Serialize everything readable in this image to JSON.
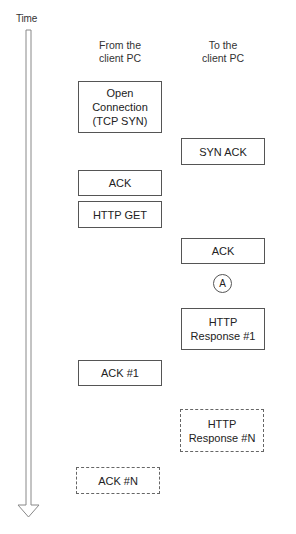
{
  "diagram": {
    "time_axis": {
      "label": "Time",
      "direction": "down"
    },
    "columns": [
      {
        "id": "from-client",
        "header": "From the\nclient PC"
      },
      {
        "id": "to-client",
        "header": "To the\nclient PC"
      }
    ],
    "messages": [
      {
        "column": "from-client",
        "label": "Open\nConnection\n(TCP SYN)",
        "style": "solid"
      },
      {
        "column": "to-client",
        "label": "SYN ACK",
        "style": "solid"
      },
      {
        "column": "from-client",
        "label": "ACK",
        "style": "solid"
      },
      {
        "column": "from-client",
        "label": "HTTP GET",
        "style": "solid"
      },
      {
        "column": "to-client",
        "label": "ACK",
        "style": "solid"
      },
      {
        "column": "to-client",
        "label": "A",
        "style": "marker"
      },
      {
        "column": "to-client",
        "label": "HTTP\nResponse #1",
        "style": "solid"
      },
      {
        "column": "from-client",
        "label": "ACK #1",
        "style": "solid"
      },
      {
        "column": "to-client",
        "label": "HTTP\nResponse #N",
        "style": "dashed"
      },
      {
        "column": "from-client",
        "label": "ACK #N",
        "style": "dashed"
      }
    ],
    "colors": {
      "stroke": "#555555",
      "text": "#222222",
      "background": "#ffffff"
    }
  }
}
